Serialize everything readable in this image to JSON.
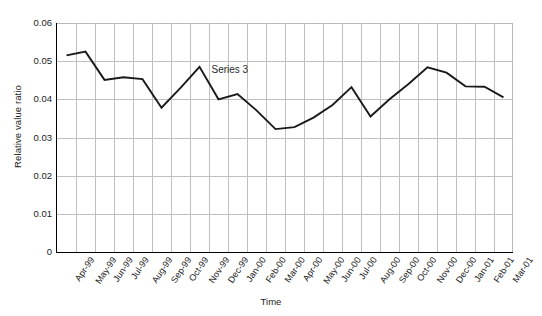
{
  "chart_data": {
    "type": "line",
    "title": "",
    "xlabel": "Time",
    "ylabel": "Relative value ratio",
    "ylim": [
      0,
      0.06
    ],
    "ytick_labels": [
      "0",
      "0.01",
      "0.02",
      "0.03",
      "0.04",
      "0.05",
      "0.06"
    ],
    "ytick_values": [
      0,
      0.01,
      0.02,
      0.03,
      0.04,
      0.05,
      0.06
    ],
    "grid": true,
    "legend_position": "inline-annotation",
    "annotations": [
      {
        "text": "Series 3",
        "x": "Nov-99",
        "y": 0.0485
      }
    ],
    "categories": [
      "Apr-99",
      "May-99",
      "Jun-99",
      "Jul-99",
      "Aug-99",
      "Sep-99",
      "Oct-99",
      "Nov-99",
      "Dec-99",
      "Jan-00",
      "Feb-00",
      "Mar-00",
      "Apr-00",
      "May-00",
      "Jun-00",
      "Jul-00",
      "Aug-00",
      "Sep-00",
      "Oct-00",
      "Nov-00",
      "Dec-00",
      "Jan-01",
      "Feb-01",
      "Mar-01"
    ],
    "series": [
      {
        "name": "Series 3",
        "color": "#1a1a1a",
        "values": [
          0.0515,
          0.0525,
          0.0451,
          0.0458,
          0.0453,
          0.0378,
          0.043,
          0.0485,
          0.04,
          0.0414,
          0.0371,
          0.0322,
          0.0327,
          0.0352,
          0.0385,
          0.0432,
          0.0355,
          0.04,
          0.044,
          0.0484,
          0.047,
          0.0434,
          0.0433,
          0.0405
        ]
      }
    ]
  }
}
